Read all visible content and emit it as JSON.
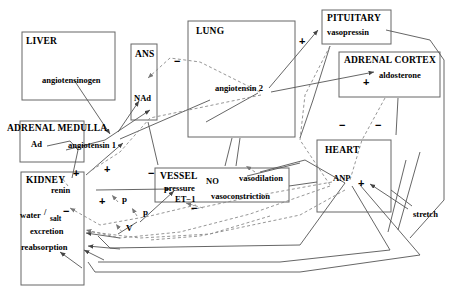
{
  "diagram": {
    "colors": {
      "line": "#555555",
      "box": "#666666",
      "text": "#000000"
    },
    "boxes": [
      {
        "id": "liver",
        "label": "LIVER",
        "x": 22,
        "y": 32,
        "w": 93,
        "h": 68
      },
      {
        "id": "ans",
        "label": "ANS",
        "x": 131,
        "y": 44,
        "w": 26,
        "h": 76
      },
      {
        "id": "lung",
        "label": "LUNG",
        "x": 188,
        "y": 21,
        "w": 107,
        "h": 116
      },
      {
        "id": "pituitary",
        "label": "PITUITARY",
        "x": 322,
        "y": 10,
        "w": 69,
        "h": 34
      },
      {
        "id": "adrenal-cortex",
        "label": "ADRENAL CORTEX",
        "x": 339,
        "y": 52,
        "w": 101,
        "h": 45
      },
      {
        "id": "adrenal-medulla",
        "label": "ADRENAL MEDULLA",
        "x": 20,
        "y": 121,
        "w": 64,
        "h": 41
      },
      {
        "id": "kidney",
        "label": "KIDNEY",
        "x": 21,
        "y": 172,
        "w": 63,
        "h": 113
      },
      {
        "id": "vessel",
        "label": "VESSEL",
        "x": 155,
        "y": 168,
        "w": 134,
        "h": 34
      },
      {
        "id": "heart",
        "label": "HEART",
        "x": 317,
        "y": 140,
        "w": 74,
        "h": 72
      }
    ],
    "node_labels": [
      {
        "id": "angiotensinogen",
        "text": "angiotensinogen",
        "x": 42,
        "y": 76
      },
      {
        "id": "nad",
        "text": "NAd",
        "x": 134,
        "y": 94
      },
      {
        "id": "angiotensin-1",
        "text": "angiotensin 1",
        "x": 68,
        "y": 141
      },
      {
        "id": "angiotensin-2",
        "text": "angiotensin 2",
        "x": 215,
        "y": 84
      },
      {
        "id": "vasopressin",
        "text": "vasopressin",
        "x": 327,
        "y": 28
      },
      {
        "id": "aldosterone",
        "text": "aldosterone",
        "x": 379,
        "y": 76
      },
      {
        "id": "ad",
        "text": "Ad",
        "x": 31,
        "y": 143
      },
      {
        "id": "renin",
        "text": "renin",
        "x": 51,
        "y": 190
      },
      {
        "id": "water-salt",
        "text": "water",
        "x": 20,
        "y": 214
      },
      {
        "id": "salt",
        "text": "salt",
        "x": 48,
        "y": 217
      },
      {
        "id": "slash",
        "text": "/",
        "x": 41,
        "y": 213
      },
      {
        "id": "excretion",
        "text": "excretion",
        "x": 28,
        "y": 230
      },
      {
        "id": "reabsorption",
        "text": "reabsorption",
        "x": 20,
        "y": 246
      },
      {
        "id": "pressure",
        "text": "pressure",
        "x": 158,
        "y": 186
      },
      {
        "id": "et1",
        "text": "ET−1",
        "x": 169,
        "y": 198
      },
      {
        "id": "no",
        "text": "NO",
        "x": 206,
        "y": 181
      },
      {
        "id": "vasodilation",
        "text": "vasodilation",
        "x": 239,
        "y": 177
      },
      {
        "id": "vasoconstriction",
        "text": "vasoconstriction",
        "x": 211,
        "y": 195
      },
      {
        "id": "anp",
        "text": "ANP",
        "x": 333,
        "y": 177
      },
      {
        "id": "stretch",
        "text": "stretch",
        "x": 415,
        "y": 213
      }
    ],
    "signs": [
      {
        "id": "sign-minus-lung-top",
        "text": "−",
        "x": 177,
        "y": 62
      },
      {
        "id": "sign-plus-angio2",
        "text": "+",
        "x": 300,
        "y": 41
      },
      {
        "id": "sign-plus-aldosterone",
        "text": "+",
        "x": 365,
        "y": 82
      },
      {
        "id": "sign-minus-heart-left",
        "text": "−",
        "x": 341,
        "y": 125
      },
      {
        "id": "sign-minus-heart-right",
        "text": "−",
        "x": 377,
        "y": 125
      },
      {
        "id": "sign-plus-kidney",
        "text": "+",
        "x": 74,
        "y": 173
      },
      {
        "id": "sign-plus-mid",
        "text": "+",
        "x": 105,
        "y": 169
      },
      {
        "id": "sign-minus-mid",
        "text": "−",
        "x": 150,
        "y": 173
      },
      {
        "id": "sign-plus-renin",
        "text": "+",
        "x": 100,
        "y": 200
      },
      {
        "id": "sign-minus-kidney",
        "text": "−",
        "x": 65,
        "y": 210
      },
      {
        "id": "sign-minus-vessel",
        "text": "−",
        "x": 193,
        "y": 208
      },
      {
        "id": "sign-plus-anp",
        "text": "+",
        "x": 360,
        "y": 183
      }
    ],
    "variables": [
      {
        "id": "var-p-upper",
        "text": "p",
        "x": 122,
        "y": 199
      },
      {
        "id": "var-p-lower",
        "text": "p",
        "x": 143,
        "y": 212
      },
      {
        "id": "var-v",
        "text": "V",
        "x": 126,
        "y": 228
      }
    ]
  }
}
